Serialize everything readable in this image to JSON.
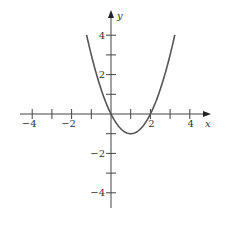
{
  "chart_data": {
    "type": "line",
    "title": "",
    "function": "y = x^2 - 2x",
    "xlabel": "x",
    "ylabel": "y",
    "xlim": [
      -4.6,
      5
    ],
    "ylim": [
      -4.8,
      5.2
    ],
    "x_ticks": [
      -4,
      -3,
      -2,
      -1,
      1,
      2,
      3,
      4
    ],
    "y_ticks": [
      -4,
      -3,
      -2,
      -1,
      1,
      2,
      3,
      4
    ],
    "x_tick_labels": [
      {
        "value": -4,
        "text": "−4"
      },
      {
        "value": -2,
        "text": "−2"
      },
      {
        "value": 2,
        "text": "2"
      },
      {
        "value": 4,
        "text": "4"
      }
    ],
    "y_tick_labels": [
      {
        "value": 4,
        "text": "4"
      },
      {
        "value": 2,
        "text": "2"
      },
      {
        "value": -2,
        "text": "−2"
      },
      {
        "value": -4,
        "text": "−4"
      }
    ],
    "grid": false,
    "legend": null,
    "series": [
      {
        "name": "parabola",
        "x": [
          -1.24,
          -1,
          -0.5,
          0,
          0.5,
          1,
          1.5,
          2,
          2.5,
          3,
          3.24
        ],
        "values": [
          4,
          3,
          1.25,
          0,
          -0.75,
          -1,
          -0.75,
          0,
          1.25,
          3,
          4
        ]
      }
    ],
    "annotations": {
      "vertex": [
        1,
        -1
      ],
      "roots": [
        0,
        2
      ]
    },
    "colors": {
      "curve": "#555555",
      "axes": "#444444",
      "text": "#333333"
    }
  }
}
